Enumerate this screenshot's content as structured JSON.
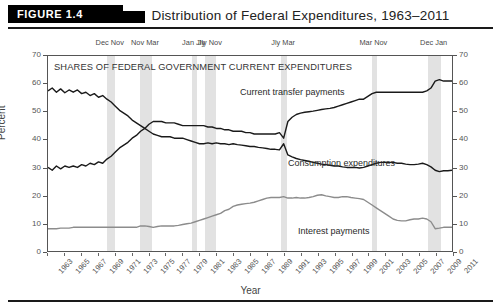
{
  "figure": {
    "badge": "FIGURE 1.4",
    "title": "Distribution of Federal Expenditures, 1963–2011"
  },
  "chart_data": {
    "type": "line",
    "title": "Distribution of Federal Expenditures, 1963–2011",
    "inchart_header": "SHARES OF FEDERAL GOVERNMENT CURRENT EXPENDITURES",
    "xlabel": "Year",
    "ylabel": "Percent",
    "ylabel_right": "Percent",
    "xlim": [
      1963,
      2011
    ],
    "ylim": [
      0,
      70
    ],
    "ytick_values": [
      0,
      10,
      20,
      30,
      40,
      50,
      60,
      70
    ],
    "ytick_labels": [
      "0",
      "10",
      "20",
      "30",
      "40",
      "50",
      "60",
      "70"
    ],
    "xtick_labels": [
      "1963",
      "1965",
      "1967",
      "1969",
      "1971",
      "1973",
      "1975",
      "1977",
      "1979",
      "1981",
      "1983",
      "1985",
      "1987",
      "1989",
      "1991",
      "1993",
      "1995",
      "1997",
      "1999",
      "2001",
      "2003",
      "2005",
      "2007",
      "2009",
      "2011"
    ],
    "grid": false,
    "legend_position": "inline-annotations",
    "line_color_dark": "#1a1a1a",
    "line_color_gray": "#8c8c8c",
    "recession_band_color": "#e2e2e2",
    "x": [
      1963,
      1963.5,
      1964,
      1964.5,
      1965,
      1965.5,
      1966,
      1966.5,
      1967,
      1967.5,
      1968,
      1968.5,
      1969,
      1969.5,
      1970,
      1970.5,
      1971,
      1971.5,
      1972,
      1972.5,
      1973,
      1973.5,
      1974,
      1974.5,
      1975,
      1975.5,
      1976,
      1976.5,
      1977,
      1977.5,
      1978,
      1978.5,
      1979,
      1979.5,
      1980,
      1980.5,
      1981,
      1981.5,
      1982,
      1982.5,
      1983,
      1983.5,
      1984,
      1984.5,
      1985,
      1985.5,
      1986,
      1986.5,
      1987,
      1987.5,
      1988,
      1988.5,
      1989,
      1989.5,
      1990,
      1990.5,
      1991,
      1991.5,
      1992,
      1992.5,
      1993,
      1993.5,
      1994,
      1994.5,
      1995,
      1995.5,
      1996,
      1996.5,
      1997,
      1997.5,
      1998,
      1998.5,
      1999,
      1999.5,
      2000,
      2000.5,
      2001,
      2001.5,
      2002,
      2002.5,
      2003,
      2003.5,
      2004,
      2004.5,
      2005,
      2005.5,
      2006,
      2006.5,
      2007,
      2007.5,
      2008,
      2008.5,
      2009,
      2009.5,
      2010,
      2010.5,
      2011
    ],
    "series": [
      {
        "name": "Consumption expenditures",
        "color": "#1a1a1a",
        "values": [
          57.5,
          58.5,
          57.0,
          58.2,
          56.8,
          57.8,
          57.0,
          57.8,
          56.5,
          57.0,
          55.8,
          56.5,
          55.2,
          55.8,
          54.5,
          53.5,
          52.0,
          50.5,
          49.5,
          48.5,
          47.0,
          46.0,
          45.0,
          44.0,
          43.0,
          42.0,
          41.5,
          41.0,
          41.0,
          41.0,
          40.5,
          40.5,
          40.5,
          40.0,
          39.5,
          39.0,
          38.5,
          38.5,
          38.8,
          38.5,
          38.8,
          38.5,
          38.5,
          38.2,
          38.5,
          38.2,
          38.0,
          37.8,
          37.5,
          37.5,
          37.2,
          37.0,
          36.8,
          36.5,
          36.5,
          36.3,
          38.5,
          34.5,
          33.8,
          33.2,
          32.8,
          32.5,
          32.2,
          31.8,
          31.5,
          31.2,
          31.0,
          30.8,
          30.5,
          30.5,
          30.2,
          30.0,
          30.0,
          30.0,
          29.8,
          30.0,
          30.5,
          31.0,
          31.5,
          31.8,
          31.8,
          31.8,
          31.8,
          31.5,
          31.5,
          31.2,
          31.0,
          31.0,
          31.2,
          31.5,
          31.0,
          30.2,
          29.0,
          28.5,
          28.8,
          28.8,
          29.0
        ]
      },
      {
        "name": "Current transfer payments",
        "color": "#1a1a1a",
        "values": [
          30.0,
          29.0,
          30.5,
          29.5,
          30.5,
          30.0,
          30.5,
          30.0,
          31.0,
          30.5,
          31.5,
          31.0,
          32.0,
          31.5,
          33.0,
          34.0,
          35.5,
          37.0,
          38.0,
          39.0,
          40.5,
          41.5,
          43.0,
          44.0,
          45.5,
          46.5,
          46.5,
          46.5,
          46.0,
          46.0,
          46.0,
          45.5,
          45.0,
          45.0,
          45.0,
          45.0,
          45.0,
          45.0,
          44.5,
          44.5,
          44.0,
          44.0,
          43.5,
          43.5,
          43.0,
          43.0,
          43.0,
          42.5,
          42.5,
          42.0,
          42.0,
          42.0,
          42.0,
          42.0,
          42.0,
          42.5,
          40.5,
          46.5,
          48.0,
          49.0,
          49.5,
          49.8,
          50.0,
          50.2,
          50.5,
          50.8,
          51.0,
          51.2,
          51.5,
          52.0,
          52.5,
          53.0,
          53.5,
          54.0,
          54.5,
          54.5,
          55.5,
          56.5,
          57.0,
          57.0,
          57.0,
          57.0,
          57.0,
          57.0,
          57.0,
          57.0,
          57.0,
          57.0,
          57.0,
          57.0,
          57.5,
          58.5,
          61.0,
          61.5,
          61.0,
          61.0,
          61.0
        ]
      },
      {
        "name": "Interest payments",
        "color": "#8c8c8c",
        "values": [
          8.0,
          8.0,
          8.0,
          8.2,
          8.2,
          8.2,
          8.5,
          8.5,
          8.5,
          8.5,
          8.5,
          8.5,
          8.5,
          8.5,
          8.5,
          8.5,
          8.5,
          8.5,
          8.5,
          8.5,
          8.5,
          8.5,
          9.0,
          9.0,
          8.8,
          8.5,
          8.8,
          9.0,
          9.0,
          9.0,
          9.0,
          9.2,
          9.5,
          9.8,
          10.0,
          10.5,
          11.0,
          11.5,
          12.0,
          12.5,
          13.0,
          13.5,
          14.5,
          15.0,
          16.0,
          16.5,
          16.8,
          17.0,
          17.2,
          17.5,
          18.0,
          18.5,
          19.0,
          19.2,
          19.2,
          19.2,
          19.5,
          19.0,
          19.0,
          19.2,
          19.0,
          19.0,
          19.2,
          19.5,
          20.0,
          20.2,
          19.8,
          19.5,
          19.2,
          19.2,
          19.5,
          19.5,
          19.2,
          19.0,
          18.8,
          18.5,
          17.5,
          16.5,
          15.5,
          14.5,
          13.5,
          12.5,
          11.5,
          11.0,
          10.8,
          10.8,
          11.2,
          11.5,
          11.5,
          11.8,
          11.5,
          10.5,
          8.0,
          8.2,
          8.5,
          8.5,
          8.5
        ]
      }
    ],
    "recessions": [
      {
        "label": "Dec Nov",
        "start": 1969.92,
        "end": 1970.92
      },
      {
        "label": "Nov Mar",
        "start": 1973.92,
        "end": 1975.25
      },
      {
        "label": "Jan Jly",
        "start": 1980.08,
        "end": 1980.58
      },
      {
        "label": "Jly Nov",
        "start": 1981.58,
        "end": 1982.92
      },
      {
        "label": "Jly Mar",
        "start": 1990.58,
        "end": 1991.25
      },
      {
        "label": "Mar Nov",
        "start": 2001.25,
        "end": 2001.92
      },
      {
        "label": "Dec Jan",
        "start": 2007.92,
        "end": 2009.5
      }
    ]
  }
}
